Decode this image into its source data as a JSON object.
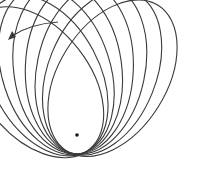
{
  "diagram": {
    "title": "",
    "type": "precessing-orbit-rosette",
    "colors": {
      "stroke": "#3a3a3a",
      "focus": "#1a1a1a",
      "background": "#ffffff"
    },
    "focus": {
      "x": 77,
      "y": 135
    },
    "orbit": {
      "semi_major": 86,
      "semi_minor": 54,
      "focus_offset": 67
    },
    "rotations_deg": [
      -128,
      -118,
      -108,
      -98,
      -88,
      -78,
      -68,
      -58
    ],
    "direction_arrow": {
      "label": "",
      "points": "precession direction"
    }
  }
}
